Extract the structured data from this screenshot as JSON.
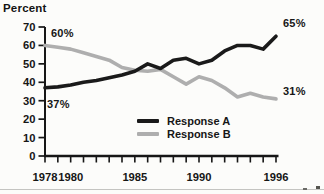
{
  "page": {
    "background": "#fcfcfa"
  },
  "chart_data": {
    "type": "line",
    "title": "",
    "ylabel": "Percent",
    "xlabel": "",
    "xlim": [
      1978,
      1996
    ],
    "ylim": [
      0,
      70
    ],
    "grid": false,
    "y_ticks": [
      0,
      10,
      20,
      30,
      40,
      50,
      60,
      70
    ],
    "x_label_years": [
      1978,
      1980,
      1985,
      1990,
      1996
    ],
    "x": [
      1978,
      1979,
      1980,
      1981,
      1982,
      1983,
      1984,
      1985,
      1986,
      1987,
      1988,
      1989,
      1990,
      1991,
      1992,
      1993,
      1994,
      1995,
      1996
    ],
    "series": [
      {
        "name": "Response A",
        "color": "#1a1a1a",
        "values": [
          37,
          37.5,
          38.5,
          40,
          41,
          42.5,
          44,
          46,
          50,
          47.5,
          52,
          53,
          50,
          52,
          57,
          60,
          60,
          58,
          65
        ]
      },
      {
        "name": "Response B",
        "color": "#aeaeae",
        "values": [
          60,
          59,
          58,
          56,
          54,
          52,
          48,
          46.5,
          46,
          47,
          43,
          39,
          43,
          41,
          37,
          32,
          34,
          32,
          31
        ]
      }
    ],
    "annotations": [
      {
        "text": "60%",
        "series": "Response B",
        "anchor": "start"
      },
      {
        "text": "37%",
        "series": "Response A",
        "anchor": "start"
      },
      {
        "text": "65%",
        "series": "Response A",
        "anchor": "end"
      },
      {
        "text": "31%",
        "series": "Response B",
        "anchor": "end"
      }
    ],
    "legend": {
      "position": "inside-bottom-right",
      "entries": [
        "Response A",
        "Response B"
      ]
    }
  }
}
